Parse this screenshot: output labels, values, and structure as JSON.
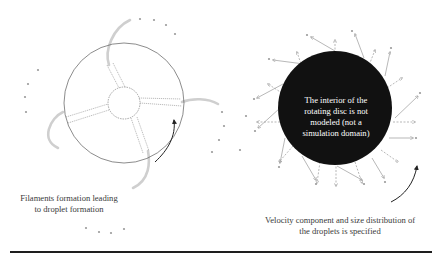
{
  "figure": {
    "left_panel": {
      "caption": "Filaments formation leading to droplet formation",
      "caption_line1": "Filaments formation leading",
      "caption_line2": "to droplet formation",
      "disc": {
        "cx": 124,
        "cy": 103,
        "r": 60,
        "stroke": "#555555"
      },
      "hub": {
        "cx": 124,
        "cy": 103,
        "r": 16,
        "style": "dashed"
      },
      "spokes": 4,
      "filament_color": "#c8c8c8",
      "droplet_color": "#999999",
      "rotation_arrow": "counterclockwise-arrow"
    },
    "right_panel": {
      "disc_label": "The interior of the rotating disc is not modeled (not a simulation domain)",
      "disc_label_lines": [
        "The interior of the",
        "rotating disc is not",
        "modeled (not a",
        "simulation domain)"
      ],
      "disc": {
        "cx": 335,
        "cy": 108,
        "r": 57,
        "fill": "#111111"
      },
      "caption_line1": "Velocity component and size distribution of",
      "caption_line2": "the droplets is specified",
      "vector_color": "#9a9a9a",
      "rotation_arrow": "counterclockwise-arrow"
    },
    "rule_color": "#1e1e1e"
  }
}
